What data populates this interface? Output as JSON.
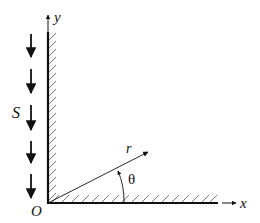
{
  "diagram": {
    "type": "wedge-flow-geometry",
    "colors": {
      "stroke": "#111111",
      "hatch": "#555555",
      "background": "#ffffff"
    },
    "axes": {
      "x_label": "x",
      "y_label": "y",
      "origin_label": "O"
    },
    "walls": [
      {
        "name": "vertical-wall",
        "orientation": "vertical",
        "hatched": true
      },
      {
        "name": "horizontal-wall",
        "orientation": "horizontal",
        "hatched": true
      }
    ],
    "flow": {
      "label": "S",
      "arrow_count": 5,
      "direction": "down"
    },
    "polar": {
      "radius_label": "r",
      "angle_label": "θ"
    }
  }
}
